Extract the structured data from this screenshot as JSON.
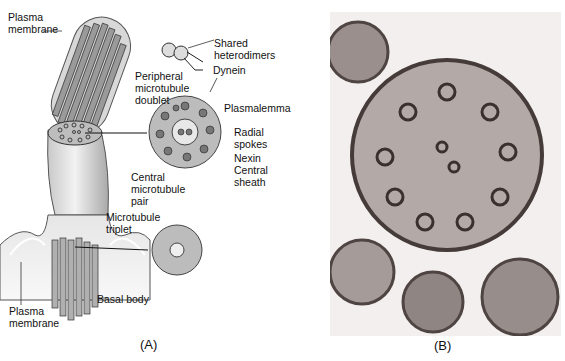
{
  "panel_a": {
    "caption": "(A)",
    "labels": {
      "plasma_membrane_top": "Plasma\nmembrane",
      "shared_heterodimers": "Shared\nheterodimers",
      "dynein": "Dynein",
      "peripheral_doublet": "Peripheral\nmicrotubule\ndoublet",
      "plasmalemma": "Plasmalemma",
      "radial_spokes": "Radial\nspokes",
      "nexin": "Nexin",
      "central_sheath": "Central\nsheath",
      "central_pair": "Central\nmicrotubule\npair",
      "microtubule_triplet": "Microtubule\ntriplet",
      "basal_body": "Basal body",
      "plasma_membrane_bottom": "Plasma\nmembrane",
      "subunit_a": "A",
      "subunit_b": "B"
    }
  },
  "panel_b": {
    "caption": "(B)"
  }
}
